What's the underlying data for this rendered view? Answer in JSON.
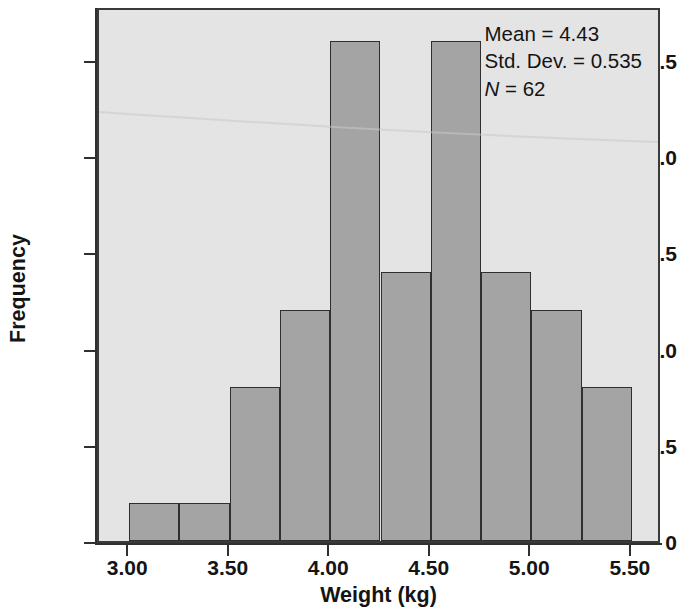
{
  "chart_data": {
    "type": "bar",
    "chart_subtype": "histogram",
    "title": "",
    "xlabel": "Weight (kg)",
    "ylabel": "Frequency",
    "xlim": [
      2.85,
      5.65
    ],
    "ylim": [
      0,
      13.9
    ],
    "bin_width": 0.25,
    "bin_edges": [
      3.0,
      3.25,
      3.5,
      3.75,
      4.0,
      4.25,
      4.5,
      4.75,
      5.0,
      5.25,
      5.5
    ],
    "categories": [
      "3.00-3.25",
      "3.25-3.50",
      "3.50-3.75",
      "3.75-4.00",
      "4.00-4.25",
      "4.25-4.50",
      "4.50-4.75",
      "4.75-5.00",
      "5.00-5.25",
      "5.25-5.50"
    ],
    "bin_centers": [
      3.125,
      3.375,
      3.625,
      3.875,
      4.125,
      4.375,
      4.625,
      4.875,
      5.125,
      5.375
    ],
    "values": [
      1,
      1,
      4,
      6,
      13,
      7,
      13,
      7,
      6,
      4
    ],
    "x_ticks": [
      3.0,
      3.5,
      4.0,
      4.5,
      5.0,
      5.5
    ],
    "x_tick_labels": [
      "3.00",
      "3.50",
      "4.00",
      "4.50",
      "5.00",
      "5.50"
    ],
    "y_ticks": [
      0,
      2.5,
      5.0,
      7.5,
      10.0,
      12.5
    ],
    "y_tick_labels": [
      "0",
      "2.5",
      "5.0",
      "7.5",
      "10.0",
      "12.5"
    ],
    "grid": false,
    "legend": "none",
    "bar_color": "#a4a4a4",
    "bar_edge_color": "#2f2f2f",
    "plot_background": "#e4e4e4",
    "figure_background": "#ffffff"
  },
  "annotations": {
    "stats": {
      "mean_label": "Mean = 4.43",
      "std_dev_label": "Std. Dev. = 0.535",
      "n_symbol": "N",
      "n_value_label": " = 62"
    }
  }
}
